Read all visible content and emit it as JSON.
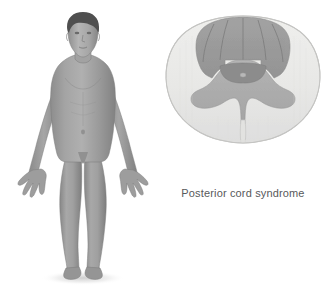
{
  "illustration": {
    "title": "Posterior cord syndrome",
    "background_color": "#ffffff",
    "panels": [
      {
        "name": "body-figure",
        "label": "anterior view of male human body with shaded sensory deficit",
        "view": "anterior",
        "subject": "adult male",
        "shading": "entire body below the head shaded gray"
      },
      {
        "name": "spinal-cord-cross-section",
        "label": "transverse section of the spinal cord",
        "affected_region": "posterior columns",
        "orientation": "posterior at top, anterior at bottom"
      }
    ]
  },
  "caption": {
    "text": "Posterior cord syndrome",
    "color": "#58595b"
  },
  "colors": {
    "background": "#ffffff",
    "white_matter": "#e9e9e7",
    "white_matter_edge": "#d6d6d4",
    "gray_matter": "#adadad",
    "affected_posterior": "#9a9a9a",
    "commissure_dark": "#8b8b8b",
    "outline": "#c9c9c7",
    "body_skin": "#9b9b9b",
    "body_shadow": "#6f6f6f",
    "body_highlight": "#bcbcbc",
    "hair": "#4a4a4a",
    "floor_shadow": "#d8d8d8",
    "caption_text": "#58595b"
  },
  "anatomy": {
    "cord_structures": [
      {
        "name": "posterior-columns",
        "state": "affected"
      },
      {
        "name": "posterior-median-septum",
        "state": "normal"
      },
      {
        "name": "posterior-horn",
        "state": "normal"
      },
      {
        "name": "anterior-horn",
        "state": "normal"
      },
      {
        "name": "gray-commissure",
        "state": "normal"
      },
      {
        "name": "central-canal",
        "state": "normal"
      },
      {
        "name": "anterior-median-fissure",
        "state": "normal"
      },
      {
        "name": "lateral-white-matter",
        "state": "normal"
      },
      {
        "name": "anterior-white-matter",
        "state": "normal"
      }
    ],
    "body_regions": [
      {
        "name": "head",
        "state": "unshaded"
      },
      {
        "name": "neck",
        "state": "shaded"
      },
      {
        "name": "torso",
        "state": "shaded"
      },
      {
        "name": "arms",
        "state": "shaded"
      },
      {
        "name": "hands",
        "state": "shaded"
      },
      {
        "name": "legs",
        "state": "shaded"
      },
      {
        "name": "feet",
        "state": "shaded"
      }
    ]
  }
}
